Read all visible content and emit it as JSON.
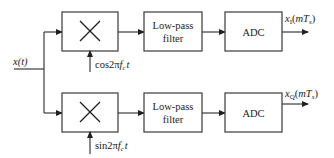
{
  "diagram": {
    "type": "block-diagram",
    "input": {
      "label": "x(t)"
    },
    "branches": [
      {
        "id": "in-phase",
        "mixer": {
          "symbol": "×",
          "label": "multiplier"
        },
        "oscillator": {
          "prefix": "cos2π",
          "f": "f",
          "f_sub": "c",
          "t": "t"
        },
        "filter": {
          "line1": "Low-pass",
          "line2": "filter"
        },
        "adc": {
          "label": "ADC"
        },
        "output": {
          "x": "x",
          "sub": "I",
          "open": "(",
          "m": "mT",
          "m_sub": "s",
          "close": ")"
        }
      },
      {
        "id": "quadrature",
        "mixer": {
          "symbol": "×",
          "label": "multiplier"
        },
        "oscillator": {
          "prefix": "sin2π",
          "f": "f",
          "f_sub": "c",
          "t": "t"
        },
        "filter": {
          "line1": "Low-pass",
          "line2": "filter"
        },
        "adc": {
          "label": "ADC"
        },
        "output": {
          "x": "x",
          "sub": "Q",
          "open": "(",
          "m": "mT",
          "m_sub": "s",
          "close": ")"
        }
      }
    ],
    "colors": {
      "stroke": "#2a2a2a",
      "text": "#222222",
      "background": "#ffffff"
    }
  }
}
